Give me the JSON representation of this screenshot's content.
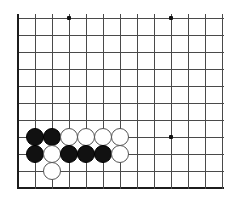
{
  "figure": {
    "kind": "go-board-diagram",
    "width": 230,
    "height": 201,
    "background_color": "#ffffff",
    "caption": ""
  },
  "board": {
    "grid_line_color": "#4a4a4a",
    "edge_line_color": "#1c1c1c",
    "origin_x": 18,
    "origin_y": 18,
    "cell_size": 17,
    "columns": 13,
    "rows": 11,
    "left_edge_emphasized": true,
    "bottom_edge_emphasized": true,
    "top_edge_emphasized": false,
    "right_edge_emphasized": false,
    "cropped_edges": [
      "top",
      "right"
    ],
    "star_point_color": "#101010",
    "star_points": [
      {
        "col": 3,
        "row": 0
      },
      {
        "col": 9,
        "row": 0
      },
      {
        "col": 9,
        "row": 7
      }
    ]
  },
  "stones": {
    "black_color": "#111111",
    "white_color": "#ffffff",
    "white_outline_color": "#555555",
    "radius": 9,
    "black_count": 7,
    "white_count": 7,
    "total_count": 14,
    "placements": [
      {
        "col": 1,
        "row": 7,
        "color": "black"
      },
      {
        "col": 2,
        "row": 7,
        "color": "black"
      },
      {
        "col": 3,
        "row": 7,
        "color": "white"
      },
      {
        "col": 4,
        "row": 7,
        "color": "white"
      },
      {
        "col": 5,
        "row": 7,
        "color": "white"
      },
      {
        "col": 6,
        "row": 7,
        "color": "white"
      },
      {
        "col": 1,
        "row": 8,
        "color": "black"
      },
      {
        "col": 2,
        "row": 8,
        "color": "white"
      },
      {
        "col": 3,
        "row": 8,
        "color": "black"
      },
      {
        "col": 4,
        "row": 8,
        "color": "black"
      },
      {
        "col": 5,
        "row": 8,
        "color": "black"
      },
      {
        "col": 6,
        "row": 8,
        "color": "white"
      },
      {
        "col": 2,
        "row": 9,
        "color": "white"
      }
    ]
  }
}
